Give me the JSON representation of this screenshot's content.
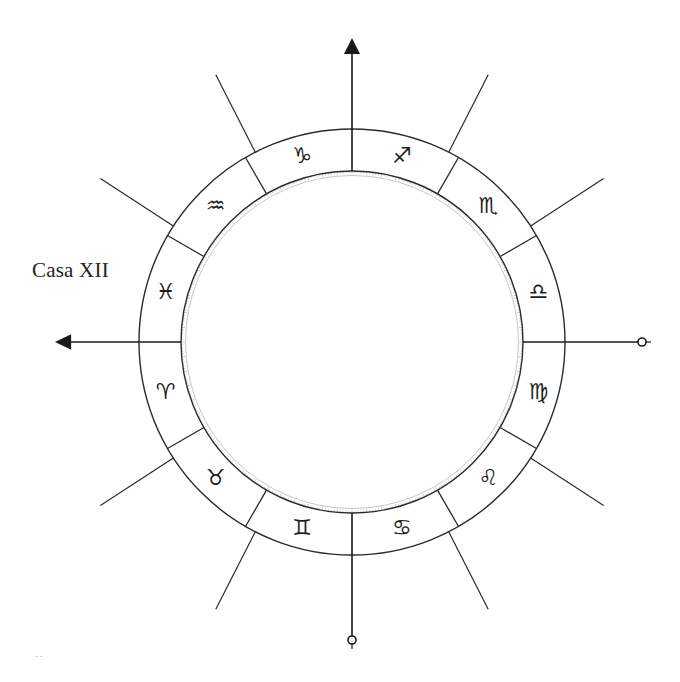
{
  "diagram": {
    "type": "astrological-chart-wheel",
    "center": [
      352,
      342
    ],
    "outer_radius": 213,
    "inner_radius": 171,
    "tick_ring_radius": 168,
    "line_color": "#2a2a2a",
    "tick_color": "#b8b8b8",
    "house_label": "Casa XII",
    "axes": [
      {
        "name": "top",
        "angle": 0,
        "end": "arrow",
        "length": 302
      },
      {
        "name": "right",
        "angle": 90,
        "end": "circle",
        "length": 286
      },
      {
        "name": "bottom",
        "angle": 180,
        "end": "circle",
        "length": 294
      },
      {
        "name": "left",
        "angle": 270,
        "end": "arrow",
        "length": 295
      }
    ],
    "ring_dividers": [
      30,
      60,
      120,
      150,
      210,
      240,
      300,
      330
    ],
    "outer_cusp_lines": [
      27,
      57,
      123,
      153,
      207,
      237,
      303,
      333
    ],
    "signs": [
      {
        "name": "Sagittarius",
        "glyph": "♐",
        "mid_angle": 15
      },
      {
        "name": "Scorpio",
        "glyph": "♏",
        "mid_angle": 45
      },
      {
        "name": "Libra",
        "glyph": "♎",
        "mid_angle": 75
      },
      {
        "name": "Virgo",
        "glyph": "♍",
        "mid_angle": 105
      },
      {
        "name": "Leo",
        "glyph": "♌",
        "mid_angle": 135
      },
      {
        "name": "Cancer",
        "glyph": "♋",
        "mid_angle": 165
      },
      {
        "name": "Gemini",
        "glyph": "♊",
        "mid_angle": 195
      },
      {
        "name": "Taurus",
        "glyph": "♉",
        "mid_angle": 225
      },
      {
        "name": "Aries",
        "glyph": "♈",
        "mid_angle": 255
      },
      {
        "name": "Pisces",
        "glyph": "♓",
        "mid_angle": 285
      },
      {
        "name": "Aquarius",
        "glyph": "♒",
        "mid_angle": 315
      },
      {
        "name": "Capricorn",
        "glyph": "♑",
        "mid_angle": 345
      }
    ],
    "artifact_text": "--"
  }
}
